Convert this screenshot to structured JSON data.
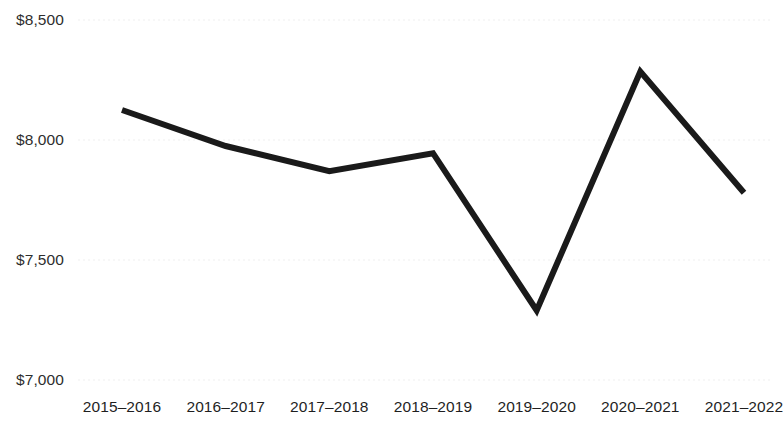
{
  "chart_data": {
    "type": "line",
    "title": "",
    "subtitle": "",
    "xlabel": "",
    "ylabel": "",
    "categories": [
      "2015–2016",
      "2016–2017",
      "2017–2018",
      "2018–2019",
      "2019–2020",
      "2020–2021",
      "2021–2022"
    ],
    "values": [
      8125,
      7975,
      7870,
      7945,
      7290,
      8285,
      7780
    ],
    "series": [
      {
        "name": "",
        "values": [
          8125,
          7975,
          7870,
          7945,
          7290,
          8285,
          7780
        ]
      }
    ],
    "ylim": [
      7000,
      8500
    ],
    "ytick_values": [
      8500,
      8000,
      7500,
      7000
    ],
    "ytick_labels": [
      "$8,500",
      "$8,000",
      "$7,500",
      "$7,000"
    ],
    "grid": true,
    "grid_style": "dotted-horizontal",
    "legend": "none",
    "line_color": "#1a1a1a",
    "grid_color": "#efefef",
    "axis_label_color": "#2e2e2e",
    "background_color": "#ffffff"
  },
  "axes": {
    "y_ticks": [
      {
        "label": "$8,500",
        "value": 8500
      },
      {
        "label": "$8,000",
        "value": 8000
      },
      {
        "label": "$7,500",
        "value": 7500
      },
      {
        "label": "$7,000",
        "value": 7000
      }
    ],
    "x_ticks": [
      {
        "label": "2015–2016"
      },
      {
        "label": "2016–2017"
      },
      {
        "label": "2017–2018"
      },
      {
        "label": "2018–2019"
      },
      {
        "label": "2019–2020"
      },
      {
        "label": "2020–2021"
      },
      {
        "label": "2021–2022"
      }
    ]
  }
}
